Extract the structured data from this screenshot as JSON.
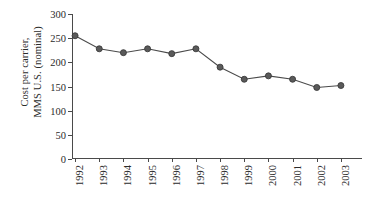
{
  "chart_data": {
    "type": "line",
    "title": "",
    "subtitle": "",
    "xlabel": "",
    "ylabel": "Cost per carrier, MMS U.S. (nominal)",
    "ylabel_line1": "Cost per carrier,",
    "ylabel_line2": "MMS U.S. (nominal)",
    "categories": [
      "1992",
      "1993",
      "1994",
      "1995",
      "1996",
      "1997",
      "1998",
      "1999",
      "2000",
      "2001",
      "2002",
      "2003"
    ],
    "values": [
      255,
      228,
      220,
      228,
      218,
      228,
      190,
      165,
      172,
      165,
      148,
      152
    ],
    "series": [
      {
        "name": "Cost per carrier",
        "values": [
          255,
          228,
          220,
          228,
          218,
          228,
          190,
          165,
          172,
          165,
          148,
          152
        ]
      }
    ],
    "ylim": [
      0,
      300
    ],
    "yticks": [
      0,
      50,
      100,
      150,
      200,
      250,
      300
    ],
    "ytick_labels": [
      "0",
      "50",
      "100",
      "150",
      "200",
      "250",
      "300"
    ],
    "xlim": [
      "1992",
      "2003"
    ],
    "grid": false,
    "legend": false,
    "legend_position": "none",
    "marker": "circle",
    "marker_color": "#5a5a5a",
    "marker_edge_color": "#3a3a3a",
    "line_color": "#4a4a4a",
    "axis_color": "#4a4a4a",
    "background_color": "#ffffff",
    "text_color": "#2b2b2b",
    "xtick_label_rotation": 90
  }
}
